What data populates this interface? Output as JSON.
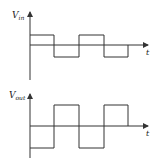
{
  "figure": {
    "line_color": "#333333",
    "background": "#ffffff"
  },
  "plots": [
    {
      "name": "input-waveform",
      "ylabel_main": "V",
      "ylabel_sub": "in",
      "xlabel": "t",
      "axis": {
        "x": 30,
        "top": 12,
        "bottom": 80,
        "zero_y": 45,
        "x_end": 148
      },
      "levels": {
        "high": 35,
        "low": 57
      },
      "transitions": [
        30,
        54,
        79,
        104,
        128
      ],
      "start_level": "high"
    },
    {
      "name": "output-waveform",
      "ylabel_main": "V",
      "ylabel_sub": "out",
      "xlabel": "t",
      "axis": {
        "x": 30,
        "top": 94,
        "bottom": 158,
        "zero_y": 126,
        "x_end": 148
      },
      "levels": {
        "high": 105,
        "low": 148
      },
      "transitions": [
        30,
        54,
        79,
        104,
        128
      ],
      "start_level": "low"
    }
  ]
}
